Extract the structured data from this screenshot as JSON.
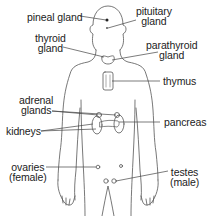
{
  "diagram": {
    "colors": {
      "outline": "#555555",
      "leader": "#444444",
      "text": "#222222",
      "background": "#ffffff"
    },
    "labels": {
      "pineal_gland": "pineal gland",
      "pituitary_gland": "pituitary\ngland",
      "thyroid_gland": "thyroid\ngland",
      "parathyroid_gland": "parathyroid\ngland",
      "thymus": "thymus",
      "adrenal_glands": "adrenal\nglands",
      "kidneys": "kidneys",
      "pancreas": "pancreas",
      "ovaries": "ovaries\n(female)",
      "testes": "testes\n(male)"
    }
  }
}
